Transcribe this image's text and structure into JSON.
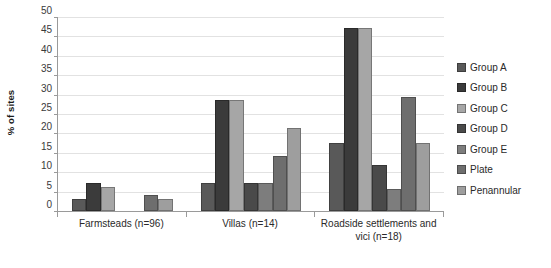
{
  "chart_data": {
    "type": "bar",
    "title": "",
    "xlabel": "",
    "ylabel": "% of sites",
    "ylim": [
      0,
      50
    ],
    "ytick_step": 5,
    "yticks": [
      50,
      45,
      40,
      35,
      30,
      25,
      20,
      15,
      10,
      5,
      0
    ],
    "grid": true,
    "legend_position": "right",
    "categories": [
      "Farmsteads (n=96)",
      "Villas (n=14)",
      "Roadside settlements and vici (n=18)"
    ],
    "series": [
      {
        "name": "Group A",
        "color": "#595959",
        "values": [
          3.1,
          7.1,
          17.6
        ]
      },
      {
        "name": "Group B",
        "color": "#3b3b3b",
        "values": [
          7.3,
          28.6,
          47.2
        ]
      },
      {
        "name": "Group C",
        "color": "#a6a6a6",
        "values": [
          6.3,
          28.6,
          47.2
        ]
      },
      {
        "name": "Group D",
        "color": "#4a4a4a",
        "values": [
          0,
          7.1,
          11.8
        ]
      },
      {
        "name": "Group E",
        "color": "#7d7d7d",
        "values": [
          0,
          7.1,
          5.6
        ]
      },
      {
        "name": "Plate",
        "color": "#6e6e6e",
        "values": [
          4.2,
          14.3,
          29.4
        ]
      },
      {
        "name": "Penannular",
        "color": "#9e9e9e",
        "values": [
          3.1,
          21.4,
          17.6
        ]
      }
    ]
  },
  "legend": {
    "items": [
      {
        "label": "Group A"
      },
      {
        "label": "Group B"
      },
      {
        "label": "Group C"
      },
      {
        "label": "Group D"
      },
      {
        "label": "Group E"
      },
      {
        "label": "Plate"
      },
      {
        "label": "Penannular"
      }
    ]
  },
  "colors": {
    "gridline": "#e2e2e2",
    "axis": "#9a9a9a",
    "text": "#2a2a2a",
    "background": "#ffffff"
  }
}
